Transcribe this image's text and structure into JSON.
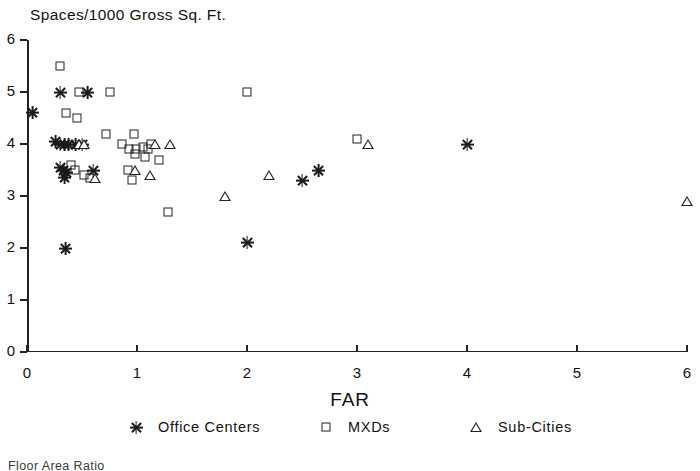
{
  "chart_data": {
    "type": "scatter",
    "title": "Spaces/1000 Gross Sq. Ft.",
    "xlabel": "FAR",
    "ylabel": "Spaces/1000 Gross Sq. Ft.",
    "xlim": [
      0,
      6
    ],
    "ylim": [
      0,
      6
    ],
    "xticks": [
      0,
      1,
      2,
      3,
      4,
      5,
      6
    ],
    "yticks": [
      0,
      1,
      2,
      3,
      4,
      5,
      6
    ],
    "xtick_labels": [
      "0",
      "1",
      "2",
      "3",
      "4",
      "5",
      "6"
    ],
    "ytick_labels": [
      "0",
      "1",
      "2",
      "3",
      "4",
      "5",
      "6"
    ],
    "grid": false,
    "legend_position": "below-axes",
    "series": [
      {
        "name": "Office Centers",
        "marker": "star-asterisk",
        "color": "#1a1a1a",
        "points": [
          [
            0.05,
            4.6
          ],
          [
            0.3,
            5.0
          ],
          [
            0.55,
            5.0
          ],
          [
            0.26,
            4.05
          ],
          [
            0.3,
            4.0
          ],
          [
            0.34,
            4.0
          ],
          [
            0.38,
            4.0
          ],
          [
            0.44,
            4.0
          ],
          [
            0.5,
            4.0
          ],
          [
            0.3,
            3.55
          ],
          [
            0.33,
            3.5
          ],
          [
            0.36,
            3.45
          ],
          [
            0.34,
            3.35
          ],
          [
            0.6,
            3.5
          ],
          [
            0.35,
            2.0
          ],
          [
            2.0,
            2.1
          ],
          [
            2.5,
            3.3
          ],
          [
            2.65,
            3.5
          ],
          [
            4.0,
            4.0
          ]
        ]
      },
      {
        "name": "MXDs",
        "marker": "square",
        "color": "#222222",
        "points": [
          [
            0.3,
            5.5
          ],
          [
            0.47,
            5.0
          ],
          [
            0.75,
            5.0
          ],
          [
            2.0,
            5.0
          ],
          [
            0.35,
            4.6
          ],
          [
            0.45,
            4.5
          ],
          [
            0.72,
            4.2
          ],
          [
            0.97,
            4.2
          ],
          [
            0.86,
            4.0
          ],
          [
            0.93,
            3.9
          ],
          [
            0.99,
            3.9
          ],
          [
            1.05,
            3.95
          ],
          [
            1.1,
            3.9
          ],
          [
            1.13,
            4.0
          ],
          [
            0.98,
            3.8
          ],
          [
            1.07,
            3.75
          ],
          [
            1.2,
            3.7
          ],
          [
            0.4,
            3.6
          ],
          [
            0.44,
            3.5
          ],
          [
            0.52,
            3.4
          ],
          [
            0.57,
            3.35
          ],
          [
            0.92,
            3.5
          ],
          [
            0.95,
            3.3
          ],
          [
            1.28,
            2.7
          ],
          [
            3.0,
            4.1
          ]
        ]
      },
      {
        "name": "Sub-Cities",
        "marker": "triangle",
        "color": "#222222",
        "points": [
          [
            0.47,
            4.0
          ],
          [
            0.52,
            4.0
          ],
          [
            1.16,
            4.0
          ],
          [
            1.3,
            4.0
          ],
          [
            0.62,
            3.35
          ],
          [
            0.98,
            3.5
          ],
          [
            1.12,
            3.4
          ],
          [
            1.8,
            3.0
          ],
          [
            2.2,
            3.4
          ],
          [
            3.1,
            4.0
          ],
          [
            6.0,
            2.9
          ]
        ]
      }
    ]
  },
  "legend": {
    "entries": [
      {
        "label": "Office Centers",
        "marker": "star-asterisk"
      },
      {
        "label": "MXDs",
        "marker": "square"
      },
      {
        "label": "Sub-Cities",
        "marker": "triangle"
      }
    ]
  },
  "caption": {
    "text": "Floor Area Ratio"
  }
}
